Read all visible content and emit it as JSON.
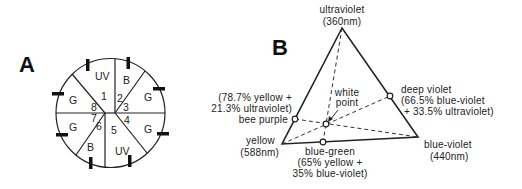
{
  "panel_a": {
    "label": "A",
    "sectors": [
      {
        "id": "1",
        "receptor": "UV"
      },
      {
        "id": "2",
        "receptor": "B"
      },
      {
        "id": "3",
        "receptor": "G"
      },
      {
        "id": "4",
        "receptor": "G"
      },
      {
        "id": "5",
        "receptor": "UV"
      },
      {
        "id": "6",
        "receptor": "B"
      },
      {
        "id": "7",
        "receptor": "G"
      },
      {
        "id": "8",
        "receptor": "G"
      }
    ]
  },
  "panel_b": {
    "label": "B",
    "vertices": {
      "ultraviolet": {
        "line1": "ultraviolet",
        "line2": "(360nm)"
      },
      "yellow": {
        "line1": "yellow",
        "line2": "(588nm)"
      },
      "blue_violet": {
        "line1": "blue-violet",
        "line2": "(440nm)"
      }
    },
    "points": {
      "white_point": {
        "line1": "white",
        "line2": "point"
      },
      "bee_purple": {
        "name": "bee purple",
        "line1": "(78.7% yellow +",
        "line2": "21.3% ultraviolet)"
      },
      "deep_violet": {
        "line1": "deep violet",
        "line2": "(66.5% blue-violet",
        "line3": "+ 33.5% ultraviolet)"
      },
      "blue_green": {
        "line1": "blue-green",
        "line2": "(65% yellow +",
        "line3": "35% blue-violet)"
      }
    }
  }
}
